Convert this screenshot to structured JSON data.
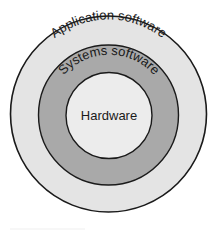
{
  "diagram": {
    "type": "concentric-layers",
    "layers": [
      {
        "name": "Application software",
        "fill": "#e4e4e4"
      },
      {
        "name": "Systems software",
        "fill": "#a9a9a9"
      },
      {
        "name": "Hardware",
        "fill": "#ececec"
      }
    ],
    "stroke": "#1a1a1a"
  }
}
